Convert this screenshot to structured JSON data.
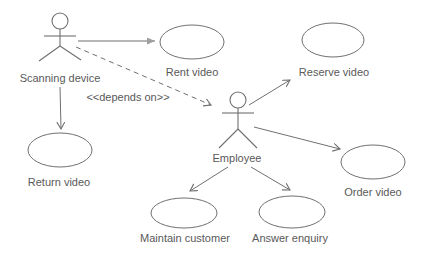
{
  "diagram": {
    "kind": "use-case-diagram"
  },
  "colors": {
    "background": "#ffffff",
    "stroke": "#707070",
    "light_arrow": "#9e9e9e",
    "text": "#595959"
  },
  "actors": {
    "scanning_device": {
      "label": "Scanning device"
    },
    "employee": {
      "label": "Employee"
    }
  },
  "use_cases": {
    "rent": {
      "label": "Rent video"
    },
    "reserve": {
      "label": "Reserve video"
    },
    "return": {
      "label": "Return video"
    },
    "order": {
      "label": "Order video"
    },
    "maintain": {
      "label": "Maintain customer"
    },
    "answer": {
      "label": "Answer enquiry"
    }
  },
  "relationships": {
    "dependency": {
      "label": "<<depends on>>"
    }
  }
}
